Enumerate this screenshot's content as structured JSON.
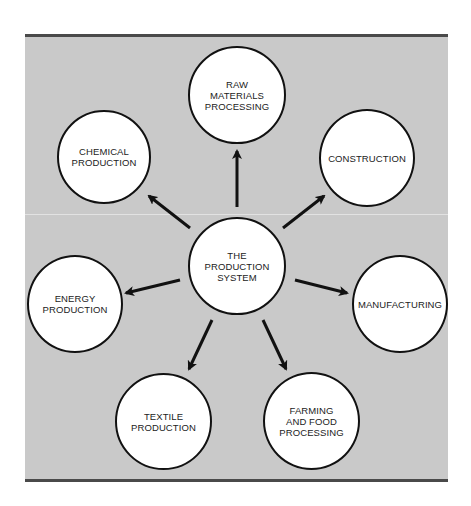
{
  "diagram": {
    "type": "hub-and-spoke",
    "background_color": "#c9c9c9",
    "border_color": "#4a4a4a",
    "hub": {
      "id": "hub",
      "label": "THE\nPRODUCTION\nSYSTEM"
    },
    "nodes": [
      {
        "id": "raw",
        "label": "RAW\nMATERIALS\nPROCESSING"
      },
      {
        "id": "chemical",
        "label": "CHEMICAL\nPRODUCTION"
      },
      {
        "id": "construction",
        "label": "CONSTRUCTION"
      },
      {
        "id": "energy",
        "label": "ENERGY\nPRODUCTION"
      },
      {
        "id": "manufacturing",
        "label": "MANUFACTURING"
      },
      {
        "id": "textile",
        "label": "TEXTILE\nPRODUCTION"
      },
      {
        "id": "farming",
        "label": "FARMING\nAND FOOD\nPROCESSING"
      }
    ],
    "edges": [
      {
        "from": "hub",
        "to": "raw"
      },
      {
        "from": "hub",
        "to": "chemical"
      },
      {
        "from": "hub",
        "to": "construction"
      },
      {
        "from": "hub",
        "to": "energy"
      },
      {
        "from": "hub",
        "to": "manufacturing"
      },
      {
        "from": "hub",
        "to": "textile"
      },
      {
        "from": "hub",
        "to": "farming"
      }
    ]
  }
}
